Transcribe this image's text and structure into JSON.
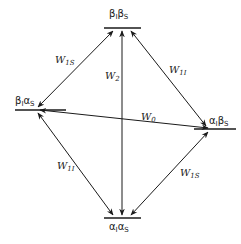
{
  "diagram": {
    "type": "energy-level transition diagram",
    "levels": {
      "top": {
        "main": "β",
        "sub1": "I",
        "main2": "β",
        "sub2": "S"
      },
      "left": {
        "main": "β",
        "sub1": "I",
        "main2": "α",
        "sub2": "S"
      },
      "right": {
        "main": "α",
        "sub1": "I",
        "main2": "β",
        "sub2": "S"
      },
      "bottom": {
        "main": "α",
        "sub1": "I",
        "main2": "α",
        "sub2": "S"
      }
    },
    "transitions": {
      "w1s_top_left": {
        "letter": "W",
        "sub": "1S",
        "from": "βIαS",
        "to": "βIβS"
      },
      "w1i_top_right": {
        "letter": "W",
        "sub": "1I",
        "from": "αIβS",
        "to": "βIβS"
      },
      "w2_vertical": {
        "letter": "W",
        "sub": "2",
        "from": "αIαS",
        "to": "βIβS"
      },
      "w0_horizontal": {
        "letter": "W",
        "sub": "0",
        "from": "βIαS",
        "to": "αIβS"
      },
      "w1i_bottom_left": {
        "letter": "W",
        "sub": "1I",
        "from": "βIαS",
        "to": "αIαS"
      },
      "w1s_bottom_right": {
        "letter": "W",
        "sub": "1S",
        "from": "αIβS",
        "to": "αIαS"
      }
    },
    "colors": {
      "line": "#1a1a1a",
      "background": "#ffffff"
    }
  }
}
